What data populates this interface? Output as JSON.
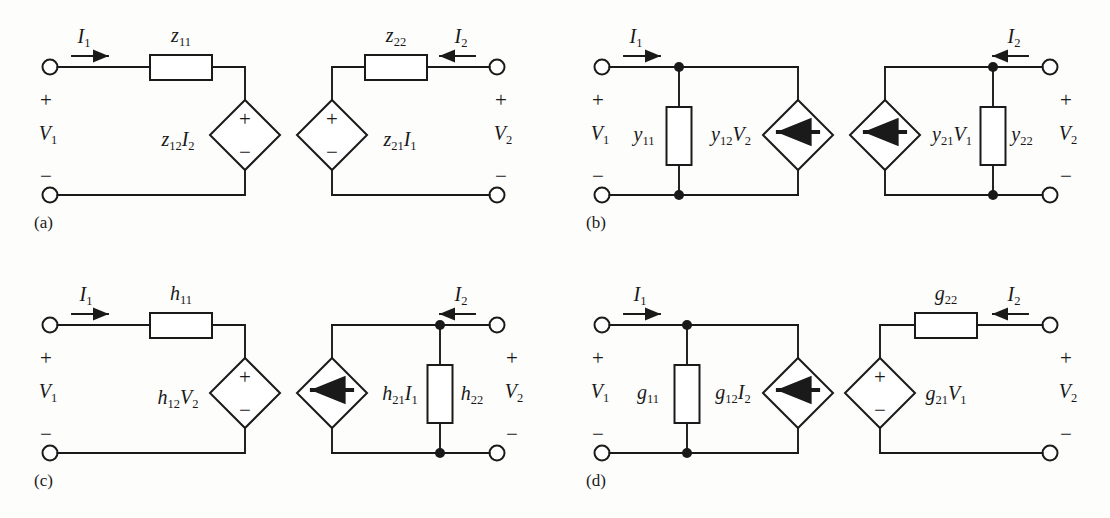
{
  "figure": {
    "stroke_color": "#1a1a1a",
    "fill_color": "#ffffff",
    "background": "#fdfdfc"
  },
  "panels": [
    {
      "tag": "(a)",
      "name": "z-parameter-model",
      "left_port": {
        "current_label": "I1",
        "voltage_label": "V1",
        "plus": "+",
        "minus": "−"
      },
      "right_port": {
        "current_label": "I2",
        "voltage_label": "V2",
        "plus": "+",
        "minus": "−"
      },
      "elements": [
        {
          "kind": "resistor",
          "label": "z11",
          "orientation": "horizontal"
        },
        {
          "kind": "voltage-source",
          "label": "z12I2",
          "polarity_top": "+",
          "polarity_bottom": "−"
        },
        {
          "kind": "voltage-source",
          "label": "z21I1",
          "polarity_top": "+",
          "polarity_bottom": "−"
        },
        {
          "kind": "resistor",
          "label": "z22",
          "orientation": "horizontal"
        }
      ]
    },
    {
      "tag": "(b)",
      "name": "y-parameter-model",
      "left_port": {
        "current_label": "I1",
        "voltage_label": "V1",
        "plus": "+",
        "minus": "−"
      },
      "right_port": {
        "current_label": "I2",
        "voltage_label": "V2",
        "plus": "+",
        "minus": "−"
      },
      "elements": [
        {
          "kind": "resistor",
          "label": "y11",
          "orientation": "vertical"
        },
        {
          "kind": "current-source",
          "label": "y12V2",
          "arrow": "down"
        },
        {
          "kind": "current-source",
          "label": "y21V1",
          "arrow": "down"
        },
        {
          "kind": "resistor",
          "label": "y22",
          "orientation": "vertical"
        }
      ]
    },
    {
      "tag": "(c)",
      "name": "h-parameter-model",
      "left_port": {
        "current_label": "I1",
        "voltage_label": "V1",
        "plus": "+",
        "minus": "−"
      },
      "right_port": {
        "current_label": "I2",
        "voltage_label": "V2",
        "plus": "+",
        "minus": "−"
      },
      "elements": [
        {
          "kind": "resistor",
          "label": "h11",
          "orientation": "horizontal"
        },
        {
          "kind": "voltage-source",
          "label": "h12V2",
          "polarity_top": "+",
          "polarity_bottom": "−"
        },
        {
          "kind": "current-source",
          "label": "h21I1",
          "arrow": "down"
        },
        {
          "kind": "resistor",
          "label": "h22",
          "orientation": "vertical"
        }
      ]
    },
    {
      "tag": "(d)",
      "name": "g-parameter-model",
      "left_port": {
        "current_label": "I1",
        "voltage_label": "V1",
        "plus": "+",
        "minus": "−"
      },
      "right_port": {
        "current_label": "I2",
        "voltage_label": "V2",
        "plus": "+",
        "minus": "−"
      },
      "elements": [
        {
          "kind": "resistor",
          "label": "g11",
          "orientation": "vertical"
        },
        {
          "kind": "current-source",
          "label": "g12I2",
          "arrow": "down"
        },
        {
          "kind": "voltage-source",
          "label": "g21V1",
          "polarity_top": "+",
          "polarity_bottom": "−"
        },
        {
          "kind": "resistor",
          "label": "g22",
          "orientation": "horizontal"
        }
      ]
    }
  ],
  "labels": {
    "a": {
      "tag": "(a)",
      "I1": "I",
      "I1sub": "1",
      "I2": "I",
      "I2sub": "2",
      "V1": "V",
      "V1sub": "1",
      "V2": "V",
      "V2sub": "2",
      "z11": "z",
      "z11sub": "11",
      "z22": "z",
      "z22sub": "22",
      "z12I2_a": "z",
      "z12I2_sub1": "12",
      "z12I2_b": "I",
      "z12I2_sub2": "2",
      "z21I1_a": "z",
      "z21I1_sub1": "21",
      "z21I1_b": "I",
      "z21I1_sub2": "1",
      "plus": "+",
      "minus": "−"
    },
    "b": {
      "tag": "(b)",
      "I1": "I",
      "I1sub": "1",
      "I2": "I",
      "I2sub": "2",
      "V1": "V",
      "V1sub": "1",
      "V2": "V",
      "V2sub": "2",
      "y11": "y",
      "y11sub": "11",
      "y22": "y",
      "y22sub": "22",
      "y12V2_a": "y",
      "y12V2_sub1": "12",
      "y12V2_b": "V",
      "y12V2_sub2": "2",
      "y21V1_a": "y",
      "y21V1_sub1": "21",
      "y21V1_b": "V",
      "y21V1_sub2": "1",
      "plus": "+",
      "minus": "−"
    },
    "c": {
      "tag": "(c)",
      "I1": "I",
      "I1sub": "1",
      "I2": "I",
      "I2sub": "2",
      "V1": "V",
      "V1sub": "1",
      "V2": "V",
      "V2sub": "2",
      "h11": "h",
      "h11sub": "11",
      "h22": "h",
      "h22sub": "22",
      "h12V2_a": "h",
      "h12V2_sub1": "12",
      "h12V2_b": "V",
      "h12V2_sub2": "2",
      "h21I1_a": "h",
      "h21I1_sub1": "21",
      "h21I1_b": "I",
      "h21I1_sub2": "1",
      "plus": "+",
      "minus": "−"
    },
    "d": {
      "tag": "(d)",
      "I1": "I",
      "I1sub": "1",
      "I2": "I",
      "I2sub": "2",
      "V1": "V",
      "V1sub": "1",
      "V2": "V",
      "V2sub": "2",
      "g11": "g",
      "g11sub": "11",
      "g22": "g",
      "g22sub": "22",
      "g12I2_a": "g",
      "g12I2_sub1": "12",
      "g12I2_b": "I",
      "g12I2_sub2": "2",
      "g21V1_a": "g",
      "g21V1_sub1": "21",
      "g21V1_b": "V",
      "g21V1_sub2": "1",
      "plus": "+",
      "minus": "−"
    }
  }
}
